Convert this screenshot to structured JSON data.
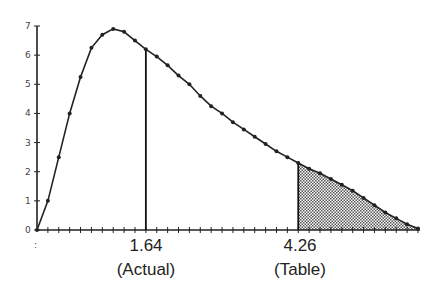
{
  "chart_data": {
    "type": "line",
    "title": "",
    "xlabel": "",
    "ylabel": "",
    "ylim": [
      0,
      7
    ],
    "yticks": [
      0,
      1,
      2,
      3,
      4,
      5,
      6,
      7
    ],
    "grid": false,
    "legend": null,
    "x_step_count": 35,
    "values": [
      0,
      1.0,
      2.5,
      4.0,
      5.25,
      6.25,
      6.7,
      6.9,
      6.8,
      6.5,
      6.2,
      5.95,
      5.65,
      5.3,
      5.0,
      4.6,
      4.25,
      4.0,
      3.7,
      3.45,
      3.2,
      2.95,
      2.7,
      2.5,
      2.3,
      2.1,
      1.95,
      1.75,
      1.55,
      1.35,
      1.1,
      0.85,
      0.6,
      0.4,
      0.2,
      0.05
    ],
    "annotations": [
      {
        "value": "1.64",
        "label": "(Actual)",
        "index": 10,
        "type": "vertical-line"
      },
      {
        "value": "4.26",
        "label": "(Table)",
        "index": 24,
        "type": "vertical-line-with-shaded-tail"
      }
    ],
    "shaded_region": {
      "from_index": 24,
      "to_index": 35,
      "pattern": "stipple"
    }
  },
  "labels": {
    "actual_value": "1.64",
    "actual_caption": "(Actual)",
    "table_value": "4.26",
    "table_caption": "(Table)"
  }
}
